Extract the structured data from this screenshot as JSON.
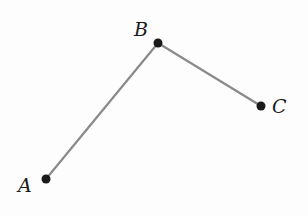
{
  "diagram": {
    "type": "polyline",
    "points": [
      {
        "id": "A",
        "label": "A",
        "x": 46,
        "y": 179,
        "label_x": 18,
        "label_y": 192
      },
      {
        "id": "B",
        "label": "B",
        "x": 158,
        "y": 43,
        "label_x": 134,
        "label_y": 36
      },
      {
        "id": "C",
        "label": "C",
        "x": 261,
        "y": 106,
        "label_x": 272,
        "label_y": 113
      }
    ],
    "segments": [
      {
        "from": "A",
        "to": "B"
      },
      {
        "from": "B",
        "to": "C"
      }
    ],
    "line_color": "#8a8a8a",
    "point_color": "#1a1a1a"
  }
}
